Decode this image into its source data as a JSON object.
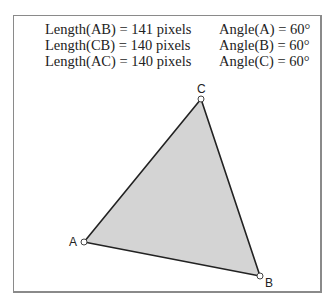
{
  "measurements": {
    "lengths": [
      {
        "label": "Length(AB) =",
        "value": "141 pixels"
      },
      {
        "label": "Length(CB) =",
        "value": "140 pixels"
      },
      {
        "label": "Length(AC) =",
        "value": "140 pixels"
      }
    ],
    "angles": [
      {
        "label": "Angle(A) =",
        "value": "60°"
      },
      {
        "label": "Angle(B) =",
        "value": "60°"
      },
      {
        "label": "Angle(C) =",
        "value": "60°"
      }
    ]
  },
  "triangle": {
    "vertices": [
      {
        "name": "A"
      },
      {
        "name": "B"
      },
      {
        "name": "C"
      }
    ],
    "fill_color": "#d4d4d4",
    "stroke_color": "#222222"
  }
}
